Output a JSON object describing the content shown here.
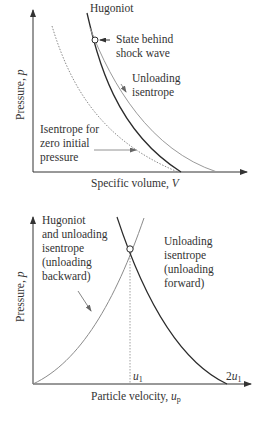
{
  "top_diagram": {
    "ylabel": "Pressure, ",
    "ylabel_var": "p",
    "xlabel": "Specific volume, ",
    "xlabel_var": "V",
    "labels": {
      "hugoniot": "Hugoniot",
      "state_behind_1": "State behind",
      "state_behind_2": "shock wave",
      "unloading_1": "Unloading",
      "unloading_2": "isentrope",
      "zero_1": "Isentrope for",
      "zero_2": "zero initial",
      "zero_3": "pressure"
    },
    "curves": [
      {
        "name": "Hugoniot",
        "style": "solid-dark"
      },
      {
        "name": "Unloading isentrope",
        "style": "solid-gray"
      },
      {
        "name": "Isentrope for zero initial pressure",
        "style": "dotted-gray"
      }
    ]
  },
  "bottom_diagram": {
    "ylabel": "Pressure, ",
    "ylabel_var": "p",
    "xlabel": "Particle velocity, ",
    "xlabel_var": "u",
    "xlabel_sub": "p",
    "labels": {
      "backward_1": "Hugoniot",
      "backward_2": "and unloading",
      "backward_3": "isentrope",
      "backward_4": "(unloading",
      "backward_5": "backward)",
      "forward_1": "Unloading",
      "forward_2": "isentrope",
      "forward_3": "(unloading",
      "forward_4": "forward)"
    },
    "ticks": {
      "u1_var": "u",
      "u1_sub": "1",
      "twou1_coef": "2",
      "twou1_var": "u",
      "twou1_sub": "1"
    },
    "curves": [
      {
        "name": "Hugoniot and unloading isentrope (unloading backward)",
        "style": "solid-gray"
      },
      {
        "name": "Unloading isentrope (unloading forward)",
        "style": "solid-dark"
      }
    ]
  },
  "colors": {
    "dark_curve": "#2b2b2b",
    "gray_curve": "#8a8a8a",
    "axis": "#333333",
    "text": "#333333"
  }
}
